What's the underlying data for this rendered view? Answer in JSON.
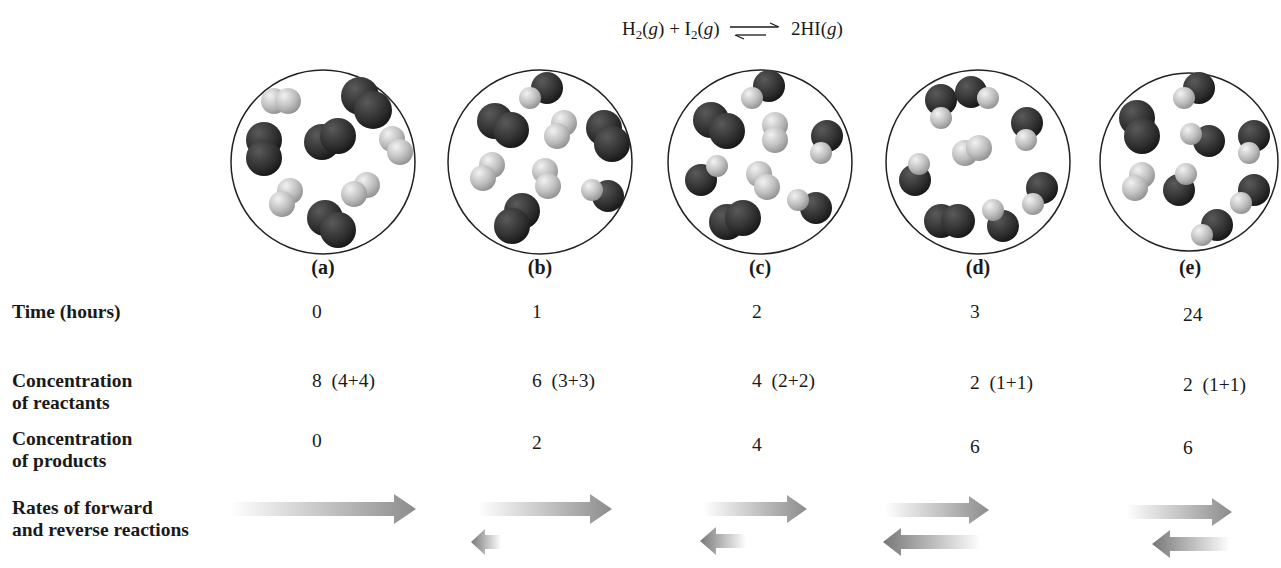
{
  "equation": {
    "reactant1": "H",
    "reactant1_sub": "2",
    "reactant1_state": "(g)",
    "plus": " + ",
    "reactant2": "I",
    "reactant2_sub": "2",
    "reactant2_state": "(g)",
    "product": "2HI",
    "product_state": "(g)",
    "arrow": "equilibrium-arrows"
  },
  "panels": [
    {
      "label": "(a)",
      "time": "0",
      "reactants": "8  (4+4)",
      "products": "0",
      "forward_rate": 1.0,
      "reverse_rate": 0.0,
      "molecules": "4 H2, 4 I2, 0 HI"
    },
    {
      "label": "(b)",
      "time": "1",
      "reactants": "6  (3+3)",
      "products": "2",
      "forward_rate": 0.72,
      "reverse_rate": 0.2,
      "molecules": "3 H2, 3 I2, 2 HI"
    },
    {
      "label": "(c)",
      "time": "2",
      "reactants": "4  (2+2)",
      "products": "4",
      "forward_rate": 0.5,
      "reverse_rate": 0.4,
      "molecules": "2 H2, 2 I2, 4 HI"
    },
    {
      "label": "(d)",
      "time": "3",
      "reactants": "2  (1+1)",
      "products": "6",
      "forward_rate": 0.4,
      "reverse_rate": 0.4,
      "molecules": "1 H2, 1 I2, 6 HI"
    },
    {
      "label": "(e)",
      "time": "24",
      "reactants": "2  (1+1)",
      "products": "6",
      "forward_rate": 0.4,
      "reverse_rate": 0.4,
      "molecules": "1 H2, 2 I2, 6 HI"
    }
  ],
  "row_labels": {
    "time": "Time (hours)",
    "reactants_line1": "Concentration",
    "reactants_line2": "of reactants",
    "products_line1": "Concentration",
    "products_line2": "of products",
    "rates_line1": "Rates of forward",
    "rates_line2": "and reverse reactions"
  },
  "colors": {
    "iodine": "#2f2f2f",
    "hydrogen": "#bdbdbd",
    "circle_border": "#222222",
    "arrow": "#8a8a8a"
  }
}
